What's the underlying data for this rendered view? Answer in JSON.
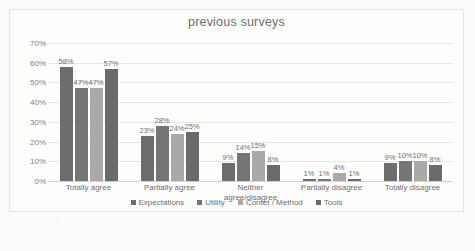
{
  "chart_data": {
    "type": "bar",
    "title": "previous surveys",
    "xlabel": "",
    "ylabel": "",
    "ylim": [
      0,
      70
    ],
    "ytick_labels": [
      "70%",
      "60%",
      "50%",
      "40%",
      "30%",
      "20%",
      "10%",
      "0%"
    ],
    "ytick_values": [
      70,
      60,
      50,
      40,
      30,
      20,
      10,
      0
    ],
    "grid": true,
    "legend_position": "bottom",
    "categories": [
      "Totally agree",
      "Partially agree",
      "Neither agree/disagree",
      "Partially disagree",
      "Totally disagree"
    ],
    "category_lines": [
      [
        "Totally agree"
      ],
      [
        "Partially agree"
      ],
      [
        "Neither",
        "agree/disagree"
      ],
      [
        "Partially disagree"
      ],
      [
        "Totally disagree"
      ]
    ],
    "series": [
      {
        "name": "Expectations",
        "color": "#6d6d6d",
        "values": [
          58,
          23,
          9,
          1,
          9
        ],
        "labels": [
          "58%",
          "23%",
          "9%",
          "1%",
          "9%"
        ]
      },
      {
        "name": "Utility",
        "color": "#757575",
        "values": [
          47,
          28,
          14,
          1,
          10
        ],
        "labels": [
          "47%",
          "28%",
          "14%",
          "1%",
          "10%"
        ]
      },
      {
        "name": "Contet / Method",
        "color": "#a9a9a9",
        "values": [
          47,
          24,
          15,
          4,
          10
        ],
        "labels": [
          "47%",
          "24%",
          "15%",
          "4%",
          "10%"
        ]
      },
      {
        "name": "Tools",
        "color": "#6a6a6a",
        "values": [
          57,
          25,
          8,
          1,
          8
        ],
        "labels": [
          "57%",
          "25%",
          "8%",
          "1%",
          "8%"
        ]
      }
    ]
  }
}
